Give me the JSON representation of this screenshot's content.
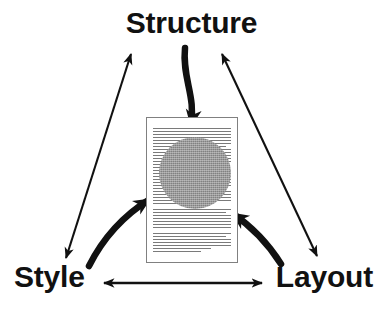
{
  "diagram": {
    "title_text": "Structure / Style / Layout document model diagram",
    "nodes": [
      {
        "id": "structure",
        "label": "Structure",
        "position": "top-center"
      },
      {
        "id": "style",
        "label": "Style",
        "position": "bottom-left"
      },
      {
        "id": "layout",
        "label": "Layout",
        "position": "bottom-right"
      }
    ],
    "center": {
      "page_label": "document-page",
      "blob_label": "document-instance-blob",
      "blob_color": "#9a9a9a",
      "page_border_color": "#808080",
      "text_line_color": "#7a7a7a",
      "text_line_count": 40
    },
    "edges": [
      {
        "id": "structure-style",
        "from": "Structure",
        "to": "Style",
        "style": "thin",
        "arrowheads": "both"
      },
      {
        "id": "structure-layout",
        "from": "Structure",
        "to": "Layout",
        "style": "thin",
        "arrowheads": "both"
      },
      {
        "id": "style-layout",
        "from": "Style",
        "to": "Layout",
        "style": "thin",
        "arrowheads": "both"
      }
    ],
    "contributions": [
      {
        "id": "structure-to-document",
        "from": "Structure",
        "to": "document",
        "style": "thick-curved",
        "arrowheads": "target"
      },
      {
        "id": "style-to-document",
        "from": "Style",
        "to": "document",
        "style": "thick-curved",
        "arrowheads": "target"
      },
      {
        "id": "layout-to-document",
        "from": "Layout",
        "to": "document",
        "style": "thick-curved",
        "arrowheads": "target"
      }
    ],
    "colors": {
      "ink": "#111111",
      "background": "#ffffff"
    }
  }
}
